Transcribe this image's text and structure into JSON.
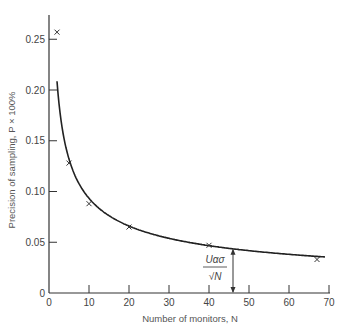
{
  "chart_data": {
    "type": "scatter",
    "title": "",
    "xlabel": "Number of monitors, N",
    "ylabel": "Precision of sampling, P × 100%",
    "xlim": [
      0,
      70
    ],
    "ylim": [
      0,
      0.27
    ],
    "x_ticks": [
      "0",
      "10",
      "20",
      "30",
      "40",
      "50",
      "60",
      "70"
    ],
    "y_ticks": [
      "0",
      "0.05",
      "0.10",
      "0.15",
      "0.20",
      "0.25"
    ],
    "grid": false,
    "series": [
      {
        "name": "observed",
        "marker": "x",
        "points": [
          {
            "x": 2,
            "y": 0.257
          },
          {
            "x": 5,
            "y": 0.128
          },
          {
            "x": 10,
            "y": 0.088
          },
          {
            "x": 20,
            "y": 0.065
          },
          {
            "x": 40,
            "y": 0.047
          },
          {
            "x": 67,
            "y": 0.033
          }
        ]
      },
      {
        "name": "fitted curve",
        "style": "line",
        "formula": "U_alpha*sigma/sqrt(N)",
        "x_range": [
          2,
          69
        ]
      }
    ],
    "annotations": [
      {
        "text_num": "Uασ",
        "text_den": "√N",
        "x": 46,
        "arrow_from": 0,
        "arrow_to": 0.043
      }
    ]
  }
}
